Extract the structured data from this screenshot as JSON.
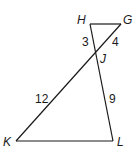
{
  "diagram": {
    "points": {
      "H": {
        "label": "H",
        "x": 90,
        "y": 24
      },
      "G": {
        "label": "G",
        "x": 121,
        "y": 24
      },
      "J": {
        "label": "J",
        "x": 96,
        "y": 55
      },
      "K": {
        "label": "K",
        "x": 16,
        "y": 141
      },
      "L": {
        "label": "L",
        "x": 113,
        "y": 141
      }
    },
    "segments": [
      {
        "from": "H",
        "to": "G"
      },
      {
        "from": "H",
        "to": "L"
      },
      {
        "from": "G",
        "to": "K"
      },
      {
        "from": "K",
        "to": "L"
      }
    ],
    "lengths": {
      "HJ": "3",
      "GJ": "4",
      "KJ": "12",
      "JL": "9"
    },
    "line_color": "#1a1a1a"
  }
}
